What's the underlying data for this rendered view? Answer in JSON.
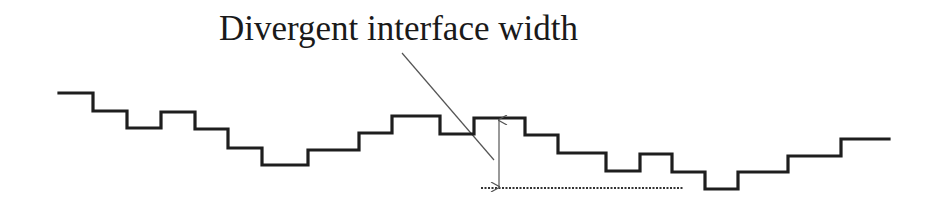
{
  "diagram": {
    "title": "Divergent interface width",
    "colors": {
      "interface_line": "#1e1e1e",
      "leader_line": "#555555",
      "arrow": "#555555",
      "baseline": "#333333",
      "background": "#ffffff"
    },
    "interface_path": [
      [
        59,
        93
      ],
      [
        93,
        93
      ],
      [
        93,
        111
      ],
      [
        127,
        111
      ],
      [
        127,
        128
      ],
      [
        161,
        128
      ],
      [
        161,
        112
      ],
      [
        195,
        112
      ],
      [
        195,
        129
      ],
      [
        228,
        129
      ],
      [
        228,
        148
      ],
      [
        262,
        148
      ],
      [
        262,
        165
      ],
      [
        308,
        165
      ],
      [
        308,
        150
      ],
      [
        359,
        150
      ],
      [
        359,
        133
      ],
      [
        392,
        133
      ],
      [
        392,
        116
      ],
      [
        440,
        116
      ],
      [
        440,
        134
      ],
      [
        474,
        134
      ],
      [
        474,
        118
      ],
      [
        525,
        118
      ],
      [
        525,
        135
      ],
      [
        558,
        135
      ],
      [
        558,
        153
      ],
      [
        606,
        153
      ],
      [
        606,
        171
      ],
      [
        640,
        171
      ],
      [
        640,
        154
      ],
      [
        672,
        154
      ],
      [
        672,
        172
      ],
      [
        705,
        172
      ],
      [
        705,
        189
      ],
      [
        738,
        189
      ],
      [
        738,
        172
      ],
      [
        788,
        172
      ],
      [
        788,
        156
      ],
      [
        841,
        156
      ],
      [
        841,
        139
      ],
      [
        889,
        139
      ]
    ],
    "width_arrow": {
      "x": 499,
      "y_top": 120,
      "y_bottom": 187
    },
    "baseline": {
      "x1": 481,
      "x2": 684,
      "y": 188
    },
    "leader_line": {
      "x1": 402,
      "y1": 53,
      "x2": 494,
      "y2": 160
    }
  }
}
